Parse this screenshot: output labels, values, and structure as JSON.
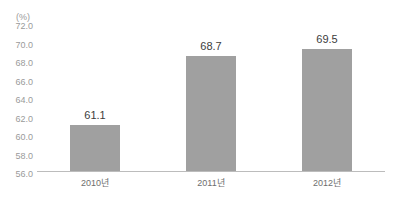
{
  "chart_data": {
    "type": "bar",
    "title": "",
    "subtitle": "",
    "xlabel": "",
    "ylabel": "",
    "unit_label": "(%)",
    "categories": [
      "2010년",
      "2011년",
      "2012년"
    ],
    "values": [
      61.1,
      68.7,
      69.5
    ],
    "value_labels": [
      "61.1",
      "68.7",
      "69.5"
    ],
    "ylim": [
      56.0,
      72.0
    ],
    "ytick_step": 2.0,
    "yticks": [
      56.0,
      58.0,
      60.0,
      62.0,
      64.0,
      66.0,
      68.0,
      70.0,
      72.0
    ],
    "ytick_labels": [
      "56.0",
      "58.0",
      "60.0",
      "62.0",
      "64.0",
      "66.0",
      "68.0",
      "70.0",
      "72.0"
    ],
    "grid": false,
    "legend": false,
    "legend_position": "none",
    "bar_color": "#a0a0a0",
    "axis_color": "#bcbcbc",
    "value_label_color": "#3c3c3c",
    "tick_label_color": "#9a9a9a",
    "category_label_color": "#6e6e6e",
    "background_color": "#ffffff"
  }
}
